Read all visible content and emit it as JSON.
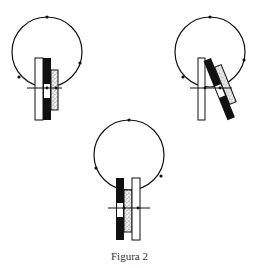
{
  "figure": {
    "caption": "Figura 2",
    "colors": {
      "stroke": "#111111",
      "white_bar": "#ffffff",
      "black_bar": "#111111",
      "textured_bar": "#e8e8e8"
    },
    "panels": [
      {
        "id": "top-left",
        "description": "circuit loop with white, black and textured bars aligned vertically"
      },
      {
        "id": "top-right",
        "description": "circuit loop with white bar vertical, black and textured bars tilted"
      },
      {
        "id": "bottom",
        "description": "circuit loop with black bar, textured bar and white bar side by side"
      }
    ]
  }
}
